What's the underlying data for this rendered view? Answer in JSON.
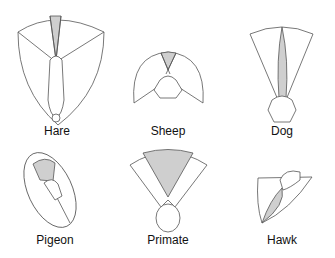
{
  "colors": {
    "binocular": "#cfcfcf",
    "line": "#555555",
    "monocular": "#ffffff"
  },
  "panels": [
    {
      "label": "Hare"
    },
    {
      "label": "Sheep"
    },
    {
      "label": "Dog"
    },
    {
      "label": "Pigeon"
    },
    {
      "label": "Primate"
    },
    {
      "label": "Hawk"
    }
  ]
}
